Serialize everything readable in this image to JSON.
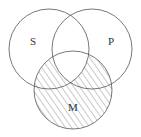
{
  "diagram": {
    "type": "venn-3",
    "sets": [
      {
        "id": "S",
        "label": "S"
      },
      {
        "id": "P",
        "label": "P"
      },
      {
        "id": "M",
        "label": "M"
      }
    ],
    "shaded_regions": [
      "M only",
      "M and S not P",
      "M and P not S"
    ],
    "unshaded_regions": [
      "S only",
      "P only",
      "S and P not M",
      "S and P and M"
    ],
    "shading_style": "diagonal-hatch",
    "stroke_color": "#555555",
    "hatch_color": "#666666"
  }
}
